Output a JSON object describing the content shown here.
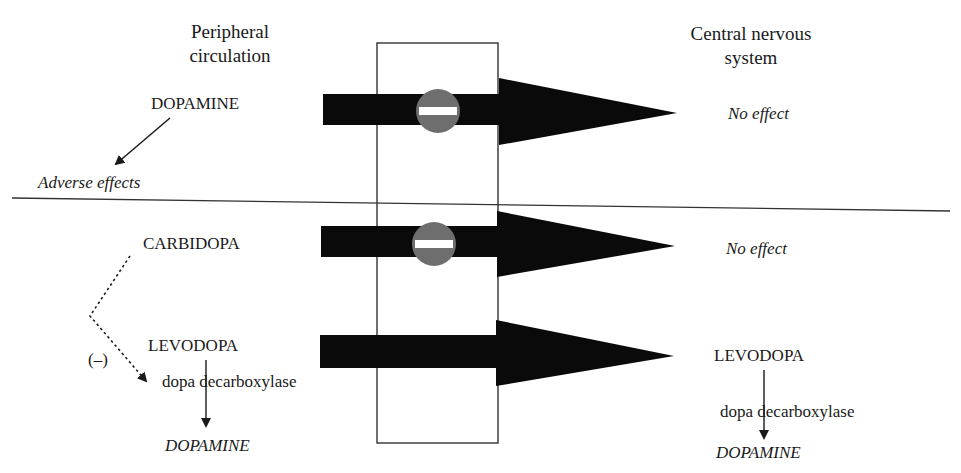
{
  "headers": {
    "peripheral": [
      "Peripheral",
      "circulation"
    ],
    "central": [
      "Central nervous",
      "system"
    ]
  },
  "top_panel": {
    "left_drug": "DOPAMINE",
    "left_outcome": "Adverse effects",
    "right_outcome": "No effect",
    "blocked": true
  },
  "bottom_panel": {
    "inhibitor": "CARBIDOPA",
    "inhibition_sign": "(–)",
    "left_precursor": "LEVODOPA",
    "left_enzyme": "dopa decarboxylase",
    "left_product": "DOPAMINE",
    "carbidopa_outcome": "No effect",
    "carbidopa_blocked": true,
    "right_precursor": "LEVODOPA",
    "right_enzyme": "dopa decarboxylase",
    "right_product": "DOPAMINE",
    "levodopa_blocked": false
  },
  "colors": {
    "arrow": "#0a0a0a",
    "no_entry_sign": "#6e6e6e",
    "no_entry_bar": "#ffffff",
    "lines": "#333333"
  }
}
